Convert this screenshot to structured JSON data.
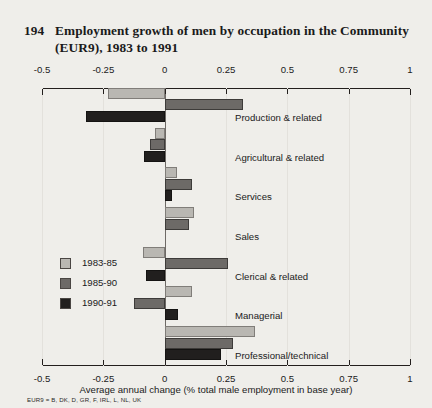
{
  "title": {
    "number": "194",
    "text": "Employment growth of men by occupation in the Community (EUR9), 1983 to 1991"
  },
  "footnote": "EUR9 = B, DK, D, GR, F, IRL, L, NL, UK",
  "legend": {
    "items": [
      {
        "label": "1983-85",
        "color": "#b9b7b2"
      },
      {
        "label": "1985-90",
        "color": "#6d6a67"
      },
      {
        "label": "1990-91",
        "color": "#211f1e"
      }
    ]
  },
  "chart_data": {
    "type": "bar",
    "orientation": "horizontal",
    "title": "Employment growth of men by occupation in the Community (EUR9), 1983 to 1991",
    "xlabel": "Average annual change (% total male employment in base year)",
    "ylabel": "",
    "xlim": [
      -0.5,
      1
    ],
    "xticks": [
      -0.5,
      -0.25,
      0,
      0.25,
      0.5,
      0.75,
      1
    ],
    "xtick_labels": [
      "-0.5",
      "-0.25",
      "0",
      "0.25",
      "0.5",
      "0.75",
      "1"
    ],
    "grid": false,
    "legend_position": "inside-left",
    "categories": [
      "Production & related",
      "Agricultural & related",
      "Services",
      "Sales",
      "Clerical & related",
      "Managerial",
      "Professional/technical"
    ],
    "series": [
      {
        "name": "1983-85",
        "color": "#b9b7b2",
        "values": [
          -0.23,
          -0.04,
          0.05,
          0.12,
          -0.09,
          0.11,
          0.37
        ]
      },
      {
        "name": "1985-90",
        "color": "#6d6a67",
        "values": [
          0.32,
          -0.06,
          0.11,
          0.1,
          0.26,
          -0.125,
          0.28
        ]
      },
      {
        "name": "1990-91",
        "color": "#211f1e",
        "values": [
          -0.32,
          -0.085,
          0.03,
          0.0,
          -0.075,
          0.055,
          0.23
        ]
      }
    ]
  }
}
